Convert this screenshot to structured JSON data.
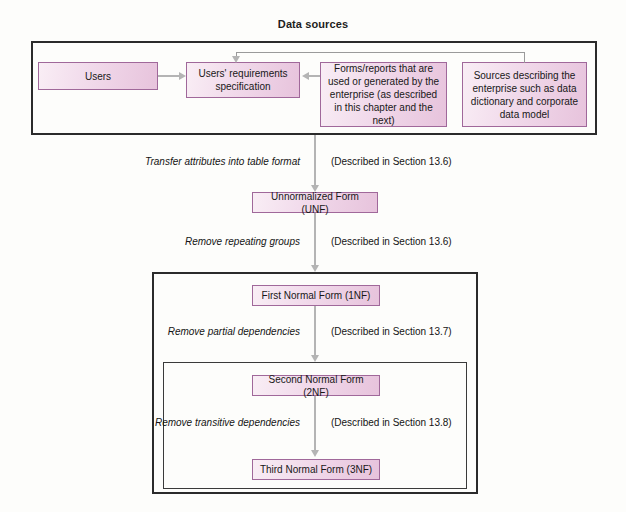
{
  "diagram": {
    "title": "Data sources",
    "type": "flowchart",
    "colors": {
      "box_fill_light": "#f9eef5",
      "box_fill_dark": "#e7c3dc",
      "box_border": "#a0689a",
      "container_border": "#2b2b2b",
      "connector": "#b4b4b4",
      "background": "#fdfdfb",
      "text": "#181818"
    }
  },
  "data_sources": {
    "container_label": "Data sources",
    "boxes": {
      "users": "Users",
      "requirements": "Users' requirements specification",
      "forms_reports": "Forms/reports that are used or generated by the enterprise (as described in this chapter and the next)",
      "sources_describing": "Sources describing the enterprise such as data dictionary and corporate data model"
    }
  },
  "stages": {
    "unf": "Unnormalized Form (UNF)",
    "first_nf": "First Normal Form (1NF)",
    "second_nf": "Second Normal Form (2NF)",
    "third_nf": "Third Normal Form (3NF)"
  },
  "transitions": [
    {
      "id": "to-unf",
      "action": "Transfer attributes into table format",
      "note": "(Described in Section 13.6)"
    },
    {
      "id": "to-1nf",
      "action": "Remove repeating groups",
      "note": "(Described in Section 13.6)"
    },
    {
      "id": "to-2nf",
      "action": "Remove partial dependencies",
      "note": "(Described in Section 13.7)"
    },
    {
      "id": "to-3nf",
      "action": "Remove transitive dependencies",
      "note": "(Described in Section 13.8)"
    }
  ]
}
